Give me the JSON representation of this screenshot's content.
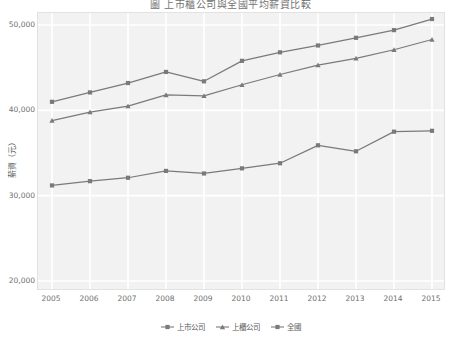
{
  "chart_data": {
    "type": "line",
    "title": "圖 上市櫃公司與全國平均薪資比較",
    "xlabel": "",
    "ylabel": "薪資（元）",
    "x": [
      2005,
      2006,
      2007,
      2008,
      2009,
      2010,
      2011,
      2012,
      2013,
      2014,
      2015
    ],
    "xtick_labels": [
      "2005",
      "2006",
      "2007",
      "2008",
      "2009",
      "2010",
      "2011",
      "2012",
      "2013",
      "2014",
      "2015"
    ],
    "ylim": [
      20000,
      50000
    ],
    "ytick_values": [
      20000,
      30000,
      40000,
      50000
    ],
    "ytick_labels": [
      "20,000",
      "30,000",
      "40,000",
      "50,000"
    ],
    "grid": true,
    "legend_position": "bottom",
    "series": [
      {
        "name": "上市公司",
        "marker": "square",
        "color": "#7a7a7a",
        "values": [
          41000,
          42100,
          43200,
          44500,
          43400,
          45800,
          46800,
          47600,
          48500,
          49400,
          50700
        ]
      },
      {
        "name": "上櫃公司",
        "marker": "triangle",
        "color": "#7a7a7a",
        "values": [
          38800,
          39800,
          40500,
          41800,
          41700,
          43000,
          44200,
          45300,
          46100,
          47100,
          48300
        ]
      },
      {
        "name": "全國",
        "marker": "square",
        "color": "#7a7a7a",
        "values": [
          31200,
          31700,
          32100,
          32900,
          32600,
          33200,
          33800,
          35900,
          35200,
          37500,
          37600
        ]
      }
    ]
  },
  "legend": {
    "items": [
      {
        "label": "上市公司"
      },
      {
        "label": "上櫃公司"
      },
      {
        "label": "全國"
      }
    ]
  },
  "colors": {
    "plot_background": "#f2f2f2",
    "gridline": "#ffffff",
    "line": "#7a7a7a",
    "tick_text": "#6f6f6f"
  }
}
